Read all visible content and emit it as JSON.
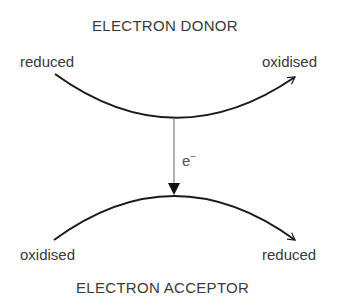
{
  "donor": {
    "title": "ELECTRON DONOR",
    "start_label": "reduced",
    "end_label": "oxidised"
  },
  "acceptor": {
    "title": "ELECTRON ACCEPTOR",
    "start_label": "oxidised",
    "end_label": "reduced"
  },
  "transfer": {
    "label": "e",
    "superscript": "−"
  },
  "colors": {
    "curve": "#1a1a1a",
    "transfer_line": "#666666",
    "text": "#3a3a3a"
  }
}
